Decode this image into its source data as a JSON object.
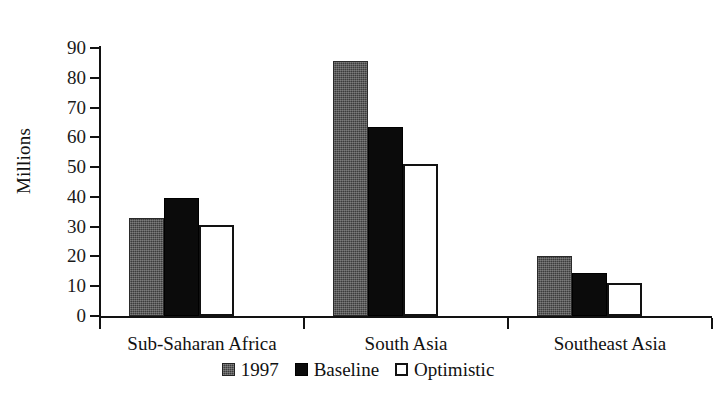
{
  "chart_data": {
    "type": "bar",
    "title": "",
    "subtitle": "",
    "xlabel": "",
    "ylabel": "Millions",
    "ylim": [
      0,
      90
    ],
    "yticks": [
      0,
      10,
      20,
      30,
      40,
      50,
      60,
      70,
      80,
      90
    ],
    "ytick_labels": [
      "0",
      "10",
      "20",
      "30",
      "40",
      "50",
      "60",
      "70",
      "80",
      "90"
    ],
    "grid": false,
    "legend_position": "bottom-center",
    "categories": [
      "Sub-Saharan  Africa",
      "South  Asia",
      "Southeast  Asia"
    ],
    "series": [
      {
        "name": "1997",
        "color": "#3c3c3c",
        "fill": "gray-dither",
        "values": [
          33,
          85.5,
          20
        ]
      },
      {
        "name": "Baseline",
        "color": "#0b0b0b",
        "fill": "solid-black",
        "values": [
          39.5,
          63.5,
          14.5
        ]
      },
      {
        "name": "Optimistic",
        "color": "#ffffff",
        "fill": "white-outline",
        "values": [
          30.5,
          51,
          11
        ]
      }
    ]
  },
  "legend": {
    "items": [
      {
        "label": "1997",
        "swatch": "gray-dither-swatch"
      },
      {
        "label": "Baseline",
        "swatch": "black-swatch"
      },
      {
        "label": "Optimistic",
        "swatch": "white-outline-swatch"
      }
    ]
  }
}
